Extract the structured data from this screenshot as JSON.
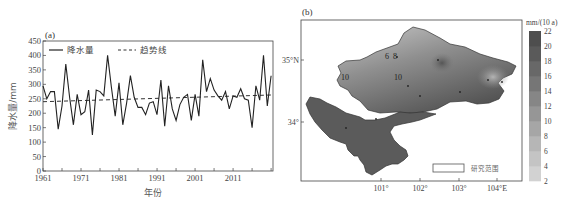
{
  "chart_data": [
    {
      "type": "line",
      "panel_label": "(a)",
      "title": "",
      "xlabel": "年份",
      "ylabel": "降水量/mm",
      "xlim": [
        1961,
        2021
      ],
      "ylim": [
        0,
        450
      ],
      "x_ticks": [
        1961,
        1971,
        1981,
        1991,
        2001,
        2011
      ],
      "y_ticks": [
        0,
        50,
        100,
        150,
        200,
        250,
        300,
        350,
        400,
        450
      ],
      "grid": false,
      "legend_position": "top-left inside",
      "x": [
        1961,
        1962,
        1963,
        1964,
        1965,
        1966,
        1967,
        1968,
        1969,
        1970,
        1971,
        1972,
        1973,
        1974,
        1975,
        1976,
        1977,
        1978,
        1979,
        1980,
        1981,
        1982,
        1983,
        1984,
        1985,
        1986,
        1987,
        1988,
        1989,
        1990,
        1991,
        1992,
        1993,
        1994,
        1995,
        1996,
        1997,
        1998,
        1999,
        2000,
        2001,
        2002,
        2003,
        2004,
        2005,
        2006,
        2007,
        2008,
        2009,
        2010,
        2011,
        2012,
        2013,
        2014,
        2015,
        2016,
        2017,
        2018,
        2019,
        2020,
        2021
      ],
      "series": [
        {
          "name": "降水量",
          "style": "solid",
          "values": [
            295,
            250,
            275,
            275,
            145,
            225,
            370,
            255,
            160,
            265,
            195,
            205,
            280,
            125,
            280,
            275,
            260,
            400,
            290,
            190,
            305,
            160,
            235,
            330,
            255,
            220,
            220,
            195,
            235,
            240,
            195,
            315,
            155,
            295,
            215,
            175,
            230,
            255,
            265,
            175,
            265,
            190,
            385,
            275,
            320,
            280,
            260,
            245,
            275,
            215,
            260,
            255,
            285,
            250,
            245,
            150,
            295,
            245,
            400,
            225,
            330
          ]
        },
        {
          "name": "趋势线",
          "style": "dashed",
          "values_endpoints": {
            "1961": 240,
            "2021": 263
          }
        }
      ]
    },
    {
      "type": "heatmap",
      "panel_label": "(b)",
      "subtype": "filled contour map",
      "x_ticks": [
        "101°",
        "102°",
        "103°",
        "104°E"
      ],
      "y_ticks": [
        "34°",
        "35°N"
      ],
      "colorbar": {
        "unit": "mm/(10 a)",
        "ticks": [
          2,
          4,
          6,
          8,
          10,
          12,
          14,
          16,
          18,
          20,
          22
        ],
        "colors": [
          "#d2d2d2",
          "#c4c4c4",
          "#b6b6b6",
          "#a6a6a6",
          "#969696",
          "#868686",
          "#767676",
          "#686868",
          "#5a5a5a",
          "#4e4e4e"
        ]
      },
      "contour_labels": [
        "6",
        "8",
        "10",
        "10"
      ],
      "legend": {
        "label": "研究范围"
      }
    }
  ],
  "panel_a": {
    "label": "(a)",
    "ylabel": "降水量/mm",
    "xlabel": "年份",
    "legend": {
      "series": "降水量",
      "trend": "趋势线"
    },
    "y_ticks": [
      "0",
      "50",
      "100",
      "150",
      "200",
      "250",
      "300",
      "350",
      "400",
      "450"
    ],
    "x_ticks": [
      "1961",
      "1971",
      "1981",
      "1991",
      "2001",
      "2011"
    ]
  },
  "panel_b": {
    "label": "(b)",
    "lat_ticks": [
      "35°N",
      "34°"
    ],
    "lon_ticks": [
      "101°",
      "102°",
      "103°",
      "104°E"
    ],
    "colorbar_unit": "mm/(10 a)",
    "colorbar_ticks": [
      "22",
      "20",
      "18",
      "16",
      "14",
      "12",
      "10",
      "8",
      "6",
      "4",
      "2"
    ],
    "legend_label": "研究范围",
    "contour_labels": [
      "6",
      "8",
      "10",
      "10"
    ]
  }
}
